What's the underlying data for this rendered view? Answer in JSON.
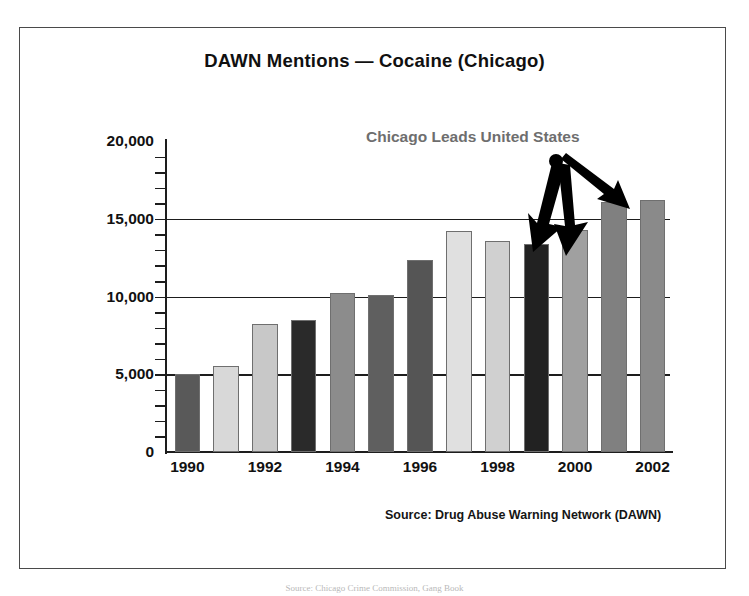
{
  "chart_data": {
    "type": "bar",
    "title": "DAWN Mentions — Cocaine (Chicago)",
    "xlabel": "",
    "ylabel": "",
    "ylim": [
      0,
      20000
    ],
    "grid": true,
    "gridlines": [
      5000,
      10000,
      15000
    ],
    "y_ticks_major": [
      "0",
      "5,000",
      "10,000",
      "15,000",
      "20,000"
    ],
    "y_tick_values_major": [
      0,
      5000,
      10000,
      15000,
      20000
    ],
    "y_minor_tick_step": 1000,
    "x_tick_labels": [
      "1990",
      "1992",
      "1994",
      "1996",
      "1998",
      "2000",
      "2002"
    ],
    "categories": [
      "1990",
      "1991",
      "1992",
      "1993",
      "1994",
      "1995",
      "1996",
      "1997",
      "1998",
      "1999",
      "2000",
      "2001",
      "2002"
    ],
    "values": [
      5000,
      5550,
      8250,
      8500,
      10250,
      10100,
      12350,
      14200,
      13600,
      13350,
      14300,
      16100,
      16200
    ],
    "bar_colors": [
      "#595959",
      "#d8d8d8",
      "#c8c8c8",
      "#2a2a2a",
      "#8c8c8c",
      "#5f5f5f",
      "#555555",
      "#e0e0e0",
      "#d0d0d0",
      "#222222",
      "#a0a0a0",
      "#808080",
      "#8a8a8a"
    ],
    "legend": [],
    "annotations": [
      {
        "text": "Chicago Leads United States",
        "color": "#6e6e6e",
        "points_to": [
          "2000",
          "2001",
          "2002"
        ]
      }
    ],
    "source_note": "Source: Drug Abuse Warning Network (DAWN)"
  },
  "figure": {
    "title": "DAWN Mentions — Cocaine (Chicago)",
    "annotation_label": "Chicago Leads United States",
    "source_note": "Source: Drug Abuse Warning Network (DAWN)",
    "caption": "Source: Chicago Crime Commission, Gang Book",
    "frame_color": "#4a4a4a",
    "axis_color": "#1d1d1d",
    "arrow_color": "#000000"
  }
}
